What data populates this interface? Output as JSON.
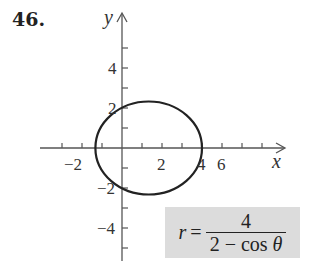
{
  "problem": {
    "number": "46."
  },
  "graph": {
    "x_axis_label": "x",
    "y_axis_label": "y",
    "x_tick_labels": [
      "−2",
      "2",
      "4",
      "6"
    ],
    "y_tick_labels": [
      "4",
      "2",
      "−2",
      "−4"
    ],
    "curve_color": "#222222",
    "axis_color": "#555555"
  },
  "equation": {
    "lhs": "r",
    "equals": "=",
    "numerator": "4",
    "denominator_prefix": "2 − cos ",
    "denominator_var": "θ",
    "box_color": "#dcdcdc"
  }
}
